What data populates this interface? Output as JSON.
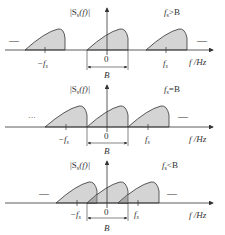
{
  "figure": {
    "panels": [
      {
        "id": "fs-gt-B",
        "spectrum_label": "|S",
        "spectrum_sub": "s",
        "spectrum_tail": "(f)|",
        "condition_f": "f",
        "condition_sub": "s",
        "condition_rel": ">B",
        "origin_label": "0",
        "neg_fs_label": "−f",
        "neg_fs_sub": "s",
        "fs_label": "f",
        "fs_sub": "s",
        "bandwidth_label": "B",
        "axis_label": "f /Hz",
        "left_ellipsis": "—",
        "right_ellipsis": "—"
      },
      {
        "id": "fs-eq-B",
        "spectrum_label": "|S",
        "spectrum_sub": "s",
        "spectrum_tail": "(f)|",
        "condition_f": "f",
        "condition_sub": "s",
        "condition_rel": "=B",
        "origin_label": "0",
        "neg_fs_label": "−f",
        "neg_fs_sub": "s",
        "fs_label": "f",
        "fs_sub": "s",
        "bandwidth_label": "B",
        "axis_label": "f /Hz",
        "left_ellipsis": "···",
        "right_ellipsis": "—"
      },
      {
        "id": "fs-lt-B",
        "spectrum_label": "|S",
        "spectrum_sub": "s",
        "spectrum_tail": "(f)|",
        "condition_f": "f",
        "condition_sub": "s",
        "condition_rel": "<B",
        "origin_label": "0",
        "neg_fs_label": "−f",
        "neg_fs_sub": "s",
        "fs_label": "f",
        "fs_sub": "s",
        "bandwidth_label": "B",
        "axis_label": "f /Hz",
        "left_ellipsis": "—",
        "right_ellipsis": "—"
      }
    ],
    "colors": {
      "fill": "#d4d4d4",
      "overlap": "#a8a8a8",
      "stroke": "#333333"
    }
  }
}
